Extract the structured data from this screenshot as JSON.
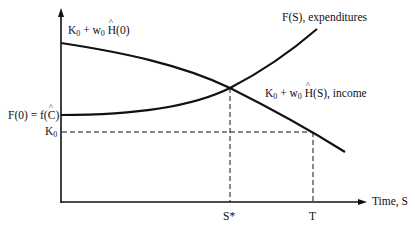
{
  "diagram": {
    "type": "economics-curve-diagram",
    "axes": {
      "x_label": "Time, S",
      "y_label": ""
    },
    "curves": [
      {
        "name": "expenditures",
        "label": "F(S), expenditures",
        "shape": "convex increasing"
      },
      {
        "name": "income",
        "label": "K0 + w0 Ĥ(S), income",
        "shape": "concave decreasing"
      }
    ],
    "labels": {
      "income_intercept": {
        "k": "K",
        "k_sub": "0",
        "plus": " + w",
        "w_sub": "0",
        "h": "H",
        "tail": "(0)"
      },
      "f0": {
        "pre": "F(0) = f(",
        "c": "C",
        "post": ")"
      },
      "k0": {
        "k": "K",
        "sub": "0"
      },
      "expenditures": "F(S), expenditures",
      "income": {
        "k": "K",
        "k_sub": "0",
        "plus": " + w",
        "w_sub": "0",
        "h": "H",
        "tail": "(S), income"
      },
      "s_star": "S*",
      "t": "T",
      "x_axis": "Time, S"
    },
    "colors": {
      "line": "#111111",
      "background": "#ffffff"
    }
  }
}
